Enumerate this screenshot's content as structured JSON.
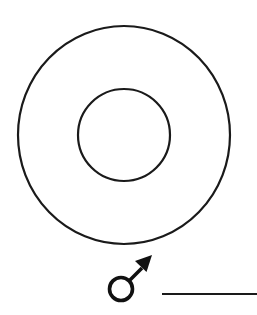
{
  "diagram": {
    "type": "concentric-circles-with-sex-symbol",
    "stroke_color": "#1a1a1a",
    "background": "#ffffff",
    "outer_circle": {
      "cx": 124,
      "cy": 135,
      "rx": 106,
      "ry": 109
    },
    "inner_circle": {
      "cx": 124,
      "cy": 135,
      "r": 46
    },
    "symbol": {
      "name": "male-symbol",
      "glyph": "♂",
      "circle": {
        "cx": 121,
        "cy": 289,
        "r": 11.5
      }
    },
    "answer_line": {
      "label": ""
    }
  }
}
